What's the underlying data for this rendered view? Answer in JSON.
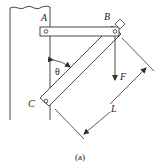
{
  "diagram": {
    "labels": {
      "A": "A",
      "B": "B",
      "C": "C",
      "theta": "θ",
      "force": "F",
      "length": "L"
    },
    "caption": "(a)",
    "colors": {
      "stroke": "#333333",
      "background": "#ffffff"
    },
    "elements": [
      "wall",
      "horizontal-bar-AB",
      "diagonal-bar-BC",
      "pin-A",
      "pin-B",
      "pin-C",
      "angle-theta-arc",
      "force-arrow-F",
      "dimension-L"
    ]
  }
}
